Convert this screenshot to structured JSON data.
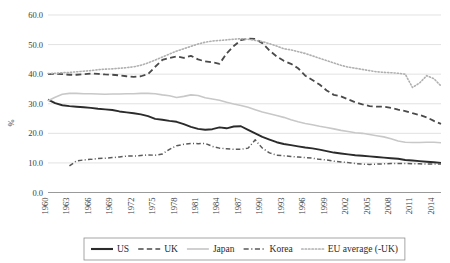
{
  "chart_data": {
    "type": "line",
    "title": "",
    "subtitle": "",
    "xlabel": "",
    "ylabel": "%",
    "ylim": [
      0.0,
      60.0
    ],
    "xlim": [
      1960,
      2015
    ],
    "grid": true,
    "legend_position": "bottom",
    "y_ticks": [
      "0.0",
      "10.0",
      "20.0",
      "30.0",
      "40.0",
      "50.0",
      "60.0"
    ],
    "y_tick_values": [
      0.0,
      10.0,
      20.0,
      30.0,
      40.0,
      50.0,
      60.0
    ],
    "x_ticks": [
      "1960",
      "1963",
      "1966",
      "1969",
      "1972",
      "1975",
      "1978",
      "1981",
      "1984",
      "1987",
      "1990",
      "1993",
      "1996",
      "1999",
      "2002",
      "2005",
      "2008",
      "2011",
      "2014"
    ],
    "x_tick_values": [
      1960,
      1963,
      1966,
      1969,
      1972,
      1975,
      1978,
      1981,
      1984,
      1987,
      1990,
      1993,
      1996,
      1999,
      2002,
      2005,
      2008,
      2011,
      2014
    ],
    "x": [
      1960,
      1961,
      1962,
      1963,
      1964,
      1965,
      1966,
      1967,
      1968,
      1969,
      1970,
      1971,
      1972,
      1973,
      1974,
      1975,
      1976,
      1977,
      1978,
      1979,
      1980,
      1981,
      1982,
      1983,
      1984,
      1985,
      1986,
      1987,
      1988,
      1989,
      1990,
      1991,
      1992,
      1993,
      1994,
      1995,
      1996,
      1997,
      1998,
      1999,
      2000,
      2001,
      2002,
      2003,
      2004,
      2005,
      2006,
      2007,
      2008,
      2009,
      2010,
      2011,
      2012,
      2013,
      2014,
      2015
    ],
    "series": [
      {
        "name": "US",
        "style": "solid",
        "color": "#2b2b2b",
        "width": 1.9,
        "values": [
          31.4,
          30.2,
          29.5,
          29.2,
          29.0,
          28.8,
          28.6,
          28.3,
          28.1,
          27.9,
          27.4,
          27.1,
          26.8,
          26.4,
          25.8,
          24.9,
          24.6,
          24.2,
          23.9,
          23.1,
          22.2,
          21.5,
          21.2,
          21.4,
          22.0,
          21.7,
          22.3,
          22.4,
          21.2,
          20.0,
          18.8,
          17.9,
          17.0,
          16.4,
          16.0,
          15.6,
          15.2,
          14.9,
          14.5,
          14.0,
          13.5,
          13.2,
          12.9,
          12.6,
          12.4,
          12.2,
          12.0,
          11.8,
          11.6,
          11.4,
          11.0,
          10.8,
          10.6,
          10.4,
          10.2,
          10.0
        ]
      },
      {
        "name": "UK",
        "style": "dashed",
        "color": "#4a4a4a",
        "width": 1.8,
        "values": [
          40.0,
          40.1,
          40.0,
          39.8,
          39.8,
          40.0,
          40.2,
          40.1,
          39.9,
          39.8,
          39.6,
          39.3,
          39.1,
          39.3,
          40.0,
          42.5,
          44.8,
          45.5,
          46.0,
          45.5,
          46.2,
          45.0,
          44.3,
          44.0,
          43.5,
          47.0,
          49.5,
          51.5,
          52.0,
          51.9,
          50.5,
          48.0,
          46.0,
          44.5,
          43.5,
          42.0,
          39.5,
          38.0,
          36.5,
          34.5,
          33.0,
          32.5,
          31.5,
          30.5,
          29.8,
          29.2,
          29.0,
          29.0,
          28.6,
          28.0,
          27.5,
          26.8,
          26.2,
          25.4,
          24.2,
          23.2
        ]
      },
      {
        "name": "Japan",
        "style": "solid",
        "color": "#c8c8c8",
        "width": 1.6,
        "values": [
          31.0,
          32.2,
          33.2,
          33.5,
          33.5,
          33.4,
          33.4,
          33.3,
          33.2,
          33.3,
          33.3,
          33.4,
          33.4,
          33.5,
          33.5,
          33.4,
          33.0,
          32.7,
          32.1,
          32.5,
          33.0,
          32.8,
          32.0,
          31.6,
          31.2,
          30.5,
          29.9,
          29.4,
          28.8,
          28.0,
          27.2,
          26.6,
          26.0,
          25.4,
          24.6,
          23.9,
          23.3,
          22.9,
          22.4,
          22.0,
          21.5,
          21.0,
          20.6,
          20.2,
          20.0,
          19.6,
          19.2,
          18.8,
          18.2,
          17.4,
          17.0,
          16.9,
          16.9,
          17.0,
          17.0,
          16.8
        ]
      },
      {
        "name": "Korea",
        "style": "dashdot",
        "color": "#5a5a5a",
        "width": 1.5,
        "start_year": 1963,
        "values": [
          null,
          null,
          null,
          9.0,
          10.7,
          11.0,
          11.2,
          11.5,
          11.6,
          11.8,
          12.0,
          12.3,
          12.3,
          12.5,
          12.7,
          12.6,
          13.0,
          14.6,
          15.8,
          16.3,
          16.6,
          16.5,
          16.6,
          15.6,
          15.0,
          14.8,
          14.6,
          14.6,
          15.0,
          17.8,
          15.0,
          13.4,
          12.6,
          12.4,
          12.2,
          12.0,
          11.8,
          11.6,
          11.2,
          11.0,
          10.6,
          10.3,
          10.1,
          9.8,
          9.6,
          9.5,
          9.6,
          9.7,
          9.8,
          9.8,
          9.8,
          9.7,
          9.7,
          9.6,
          9.6,
          9.6
        ]
      },
      {
        "name": "EU average (-UK)",
        "style": "dotted",
        "color": "#b0b0b0",
        "width": 1.6,
        "values": [
          40.2,
          40.3,
          40.5,
          40.6,
          40.8,
          41.0,
          41.2,
          41.5,
          41.7,
          41.8,
          42.0,
          42.2,
          42.5,
          43.0,
          43.8,
          44.8,
          45.8,
          46.8,
          47.8,
          48.6,
          49.4,
          50.2,
          50.8,
          51.2,
          51.4,
          51.6,
          51.8,
          52.0,
          51.8,
          51.4,
          51.0,
          50.3,
          49.5,
          48.6,
          48.2,
          47.6,
          47.0,
          46.2,
          45.4,
          44.6,
          43.8,
          43.0,
          42.4,
          42.0,
          41.6,
          41.2,
          40.8,
          40.6,
          40.5,
          40.3,
          40.0,
          35.5,
          37.0,
          39.5,
          38.5,
          36.0
        ]
      }
    ]
  },
  "legend": {
    "items": [
      {
        "label": "US",
        "style": "solid",
        "color": "#2b2b2b"
      },
      {
        "label": "UK",
        "style": "dashed",
        "color": "#4a4a4a"
      },
      {
        "label": "Japan",
        "style": "solid",
        "color": "#c8c8c8"
      },
      {
        "label": "Korea",
        "style": "dashdot",
        "color": "#5a5a5a"
      },
      {
        "label": "EU average (-UK)",
        "style": "dotted",
        "color": "#b0b0b0"
      }
    ]
  },
  "axis": {
    "y_title": "%"
  }
}
